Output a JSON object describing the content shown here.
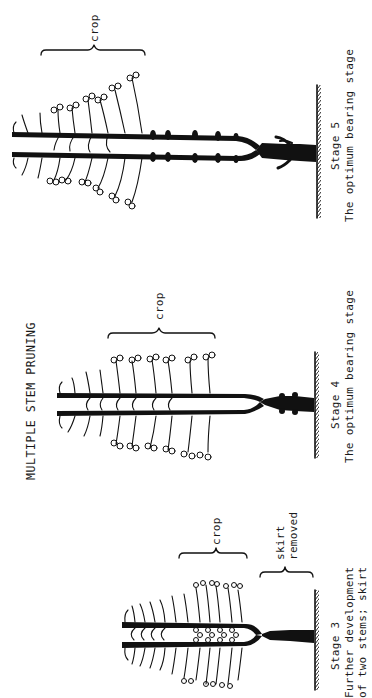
{
  "figure": {
    "title": "MULTIPLE STEM PRUNING",
    "orientation": "rotated 90° counter-clockwise",
    "colors": {
      "ink": "#111111",
      "background": "#ffffff"
    }
  },
  "stages": [
    {
      "id": "stage5",
      "stage_label": "Stage 5",
      "caption_lines": [
        "The optimum bearing stage"
      ],
      "brackets": [
        {
          "label": "crop"
        }
      ]
    },
    {
      "id": "stage4",
      "stage_label": "Stage 4",
      "caption_lines": [
        "The optimum bearing stage"
      ],
      "brackets": [
        {
          "label": "crop"
        }
      ]
    },
    {
      "id": "stage3",
      "stage_label": "Stage 3",
      "caption_lines": [
        "Further development",
        "of two stems; skirt"
      ],
      "brackets": [
        {
          "label": "crop"
        },
        {
          "label_lines": [
            "skirt",
            "removed"
          ]
        }
      ]
    }
  ]
}
